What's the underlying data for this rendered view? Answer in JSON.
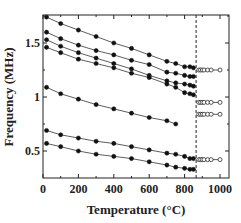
{
  "chart_data": {
    "type": "line",
    "title": "",
    "xlabel": "Temperature (°C)",
    "ylabel": "Frequency (MHz)",
    "xlim": [
      0,
      1050
    ],
    "ylim": [
      0.3,
      1.8
    ],
    "xticks": [
      0,
      200,
      400,
      600,
      800,
      1000
    ],
    "xtick_labels": [
      "0",
      "200",
      "400",
      "600",
      "800",
      "1000"
    ],
    "yticks": [
      0.5,
      1.0,
      1.5
    ],
    "ytick_labels": [
      "0.5",
      "1",
      "1.5"
    ],
    "grid": false,
    "legend": null,
    "vline": {
      "x": 865,
      "style": "dashed"
    },
    "series": [
      {
        "name": "mode 1",
        "marker": "filled-circle",
        "x": [
          20,
          100,
          200,
          300,
          400,
          500,
          600,
          700,
          750,
          800,
          830,
          850
        ],
        "values": [
          1.74,
          1.68,
          1.62,
          1.56,
          1.5,
          1.45,
          1.39,
          1.33,
          1.31,
          1.28,
          1.28,
          1.27
        ]
      },
      {
        "name": "mode 2",
        "marker": "filled-circle",
        "x": [
          20,
          100,
          200,
          300,
          400,
          500,
          600,
          700,
          750,
          800,
          830,
          850
        ],
        "values": [
          1.6,
          1.54,
          1.48,
          1.43,
          1.39,
          1.34,
          1.3,
          1.23,
          1.22,
          1.2,
          1.19,
          1.19
        ]
      },
      {
        "name": "mode 3",
        "marker": "filled-circle",
        "x": [
          20,
          100,
          200,
          300,
          400,
          500,
          600,
          700,
          750,
          800,
          830,
          850
        ],
        "values": [
          1.53,
          1.47,
          1.41,
          1.36,
          1.31,
          1.26,
          1.2,
          1.15,
          1.13,
          1.12,
          1.11,
          1.1
        ]
      },
      {
        "name": "mode 4",
        "marker": "filled-circle",
        "x": [
          20,
          100,
          200,
          300,
          400,
          500,
          600,
          700,
          750,
          800,
          830,
          850
        ],
        "values": [
          1.46,
          1.41,
          1.35,
          1.31,
          1.27,
          1.22,
          1.18,
          1.12,
          1.09,
          1.04,
          1.03,
          1.02
        ]
      },
      {
        "name": "mode 5",
        "marker": "filled-circle",
        "x": [
          20,
          100,
          200,
          300,
          400,
          500,
          600,
          700,
          750
        ],
        "values": [
          1.09,
          1.03,
          0.98,
          0.93,
          0.89,
          0.85,
          0.81,
          0.78,
          0.75
        ]
      },
      {
        "name": "mode 6",
        "marker": "filled-circle",
        "x": [
          20,
          100,
          200,
          300,
          400,
          500,
          600,
          700,
          750,
          800,
          830,
          850
        ],
        "values": [
          0.69,
          0.65,
          0.62,
          0.59,
          0.57,
          0.54,
          0.51,
          0.48,
          0.47,
          0.45,
          0.43,
          0.43
        ]
      },
      {
        "name": "mode 7",
        "marker": "filled-circle",
        "x": [
          20,
          100,
          200,
          300,
          400,
          500,
          600,
          700,
          750,
          800,
          830,
          850
        ],
        "values": [
          0.57,
          0.54,
          0.5,
          0.47,
          0.45,
          0.43,
          0.4,
          0.37,
          0.35,
          0.34,
          0.33,
          0.33
        ]
      },
      {
        "name": "high-T 1",
        "marker": "open-circle",
        "x": [
          880,
          890,
          900,
          910,
          930,
          950,
          1000
        ],
        "values": [
          1.25,
          1.25,
          1.25,
          1.25,
          1.25,
          1.25,
          1.25
        ]
      },
      {
        "name": "high-T 2",
        "marker": "open-circle",
        "x": [
          880,
          890,
          900,
          910,
          930,
          950,
          1000
        ],
        "values": [
          0.95,
          0.95,
          0.95,
          0.95,
          0.95,
          0.95,
          0.95
        ]
      },
      {
        "name": "high-T 3",
        "marker": "open-circle",
        "x": [
          880,
          890,
          900,
          910,
          930,
          950,
          1000
        ],
        "values": [
          0.84,
          0.84,
          0.84,
          0.84,
          0.84,
          0.84,
          0.84
        ]
      },
      {
        "name": "high-T 4",
        "marker": "open-circle",
        "x": [
          880,
          890,
          900,
          910,
          930,
          950,
          1000
        ],
        "values": [
          0.42,
          0.42,
          0.42,
          0.42,
          0.42,
          0.42,
          0.42
        ]
      }
    ]
  },
  "colors": {
    "line": "#333333",
    "marker": "#111111",
    "axis": "#222222"
  }
}
